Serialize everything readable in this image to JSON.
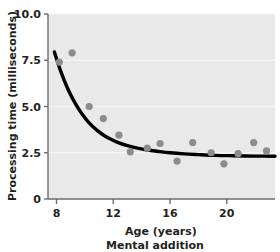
{
  "chart_data": {
    "type": "scatter",
    "title": "",
    "caption": "Mental addition",
    "xlabel": "Age (years)",
    "ylabel": "Processing time (milliseconds)",
    "xlim": [
      7.4,
      23.4
    ],
    "ylim": [
      0,
      10.0
    ],
    "xticks": [
      8,
      12,
      16,
      20
    ],
    "xticklabels": [
      "8",
      "12",
      "16",
      "20"
    ],
    "yticks": [
      0,
      2.5,
      5.0,
      7.5,
      10.0
    ],
    "yticklabels": [
      "0",
      "2.5",
      "5.0",
      "7.5",
      "10.0"
    ],
    "grid": true,
    "grid_axis": "y",
    "legend": "none",
    "plot_background": "#e9e9e9",
    "point_color": "#8c8c8c",
    "curve_color": "#000000",
    "series": [
      {
        "name": "Mental addition",
        "marker": "circle",
        "points": [
          {
            "x": 8.2,
            "y": 7.4
          },
          {
            "x": 9.1,
            "y": 7.9
          },
          {
            "x": 10.3,
            "y": 5.0
          },
          {
            "x": 11.3,
            "y": 4.35
          },
          {
            "x": 12.4,
            "y": 3.45
          },
          {
            "x": 13.2,
            "y": 2.55
          },
          {
            "x": 14.4,
            "y": 2.75
          },
          {
            "x": 15.3,
            "y": 3.0
          },
          {
            "x": 16.5,
            "y": 2.05
          },
          {
            "x": 17.6,
            "y": 3.05
          },
          {
            "x": 18.9,
            "y": 2.5
          },
          {
            "x": 19.8,
            "y": 1.9
          },
          {
            "x": 20.8,
            "y": 2.45
          },
          {
            "x": 21.9,
            "y": 3.05
          },
          {
            "x": 22.8,
            "y": 2.6
          }
        ]
      }
    ],
    "fit_curve": {
      "name": "exponential decay fit",
      "description": "y = 2.30 + 22.0 * exp(-(x - 7.85) / 2.05)",
      "asymptote": 2.3,
      "x_start": 7.85,
      "x_end": 23.4,
      "points": [
        {
          "x": 7.85,
          "y": 7.95
        },
        {
          "x": 8.3,
          "y": 6.9
        },
        {
          "x": 8.8,
          "y": 5.95
        },
        {
          "x": 9.3,
          "y": 5.2
        },
        {
          "x": 9.8,
          "y": 4.6
        },
        {
          "x": 10.3,
          "y": 4.12
        },
        {
          "x": 10.8,
          "y": 3.75
        },
        {
          "x": 11.3,
          "y": 3.46
        },
        {
          "x": 11.8,
          "y": 3.24
        },
        {
          "x": 12.4,
          "y": 3.03
        },
        {
          "x": 13.0,
          "y": 2.88
        },
        {
          "x": 13.7,
          "y": 2.75
        },
        {
          "x": 14.4,
          "y": 2.65
        },
        {
          "x": 15.2,
          "y": 2.57
        },
        {
          "x": 16.0,
          "y": 2.5
        },
        {
          "x": 17.0,
          "y": 2.44
        },
        {
          "x": 18.0,
          "y": 2.4
        },
        {
          "x": 19.2,
          "y": 2.36
        },
        {
          "x": 20.5,
          "y": 2.34
        },
        {
          "x": 22.0,
          "y": 2.32
        },
        {
          "x": 23.4,
          "y": 2.31
        }
      ]
    }
  },
  "figure": {
    "axis_line_color": "#6d6d6d",
    "gridline_color": "#f4f4f4"
  }
}
